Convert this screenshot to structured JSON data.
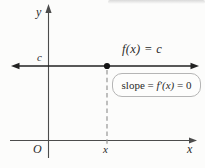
{
  "figure": {
    "labels": {
      "y_axis": "y",
      "x_axis": "x",
      "origin": "O",
      "constant": "c",
      "point_x": "x",
      "function": "f(x) = c"
    },
    "slope_box": {
      "prefix": "slope = ",
      "func": "f′(x)",
      "suffix": " = 0"
    },
    "colors": {
      "axis": "#4c4c4c",
      "curve": "#222222",
      "dash": "#8c8c8c",
      "point": "#141414",
      "box_border": "#b5b5b5",
      "background": "#fcfcfb"
    }
  }
}
